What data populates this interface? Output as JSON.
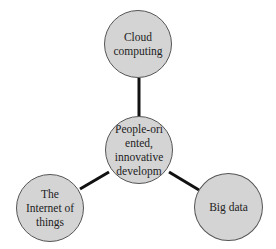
{
  "diagram": {
    "type": "hub-and-spoke",
    "colors": {
      "node_fill": "#d4d4d4",
      "node_border": "#555555",
      "connector": "#111111",
      "text": "#222222"
    },
    "center": {
      "id": "center",
      "label": "People-ori ented, innovative developm",
      "lines": [
        "People-ori",
        "ented,",
        "innovative",
        "developm"
      ],
      "cx": 139,
      "cy": 150,
      "r": 34
    },
    "nodes": [
      {
        "id": "cloud",
        "label": "Cloud computing",
        "lines": [
          "Cloud",
          "computing"
        ],
        "cx": 138,
        "cy": 44,
        "r": 34
      },
      {
        "id": "iot",
        "label": "The Internet of things",
        "lines": [
          "The",
          "Internet of",
          "things"
        ],
        "cx": 50,
        "cy": 208,
        "r": 34
      },
      {
        "id": "bigdata",
        "label": "Big data",
        "lines": [
          "Big data"
        ],
        "cx": 228,
        "cy": 207,
        "r": 34
      }
    ],
    "edges": [
      {
        "from": "center",
        "to": "cloud"
      },
      {
        "from": "center",
        "to": "iot"
      },
      {
        "from": "center",
        "to": "bigdata"
      }
    ]
  }
}
